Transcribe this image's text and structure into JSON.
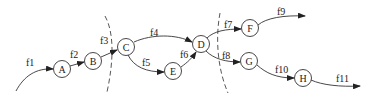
{
  "diagram": {
    "type": "directed-flow-graph",
    "nodes": [
      {
        "id": "A",
        "label": "A",
        "x": 62,
        "y": 69
      },
      {
        "id": "B",
        "label": "B",
        "x": 93,
        "y": 61
      },
      {
        "id": "C",
        "label": "C",
        "x": 126,
        "y": 47
      },
      {
        "id": "D",
        "label": "D",
        "x": 201,
        "y": 44
      },
      {
        "id": "E",
        "label": "E",
        "x": 173,
        "y": 71
      },
      {
        "id": "F",
        "label": "F",
        "x": 250,
        "y": 28
      },
      {
        "id": "G",
        "label": "G",
        "x": 249,
        "y": 61
      },
      {
        "id": "H",
        "label": "H",
        "x": 303,
        "y": 78
      }
    ],
    "edges": [
      {
        "label": "f1",
        "from": null,
        "to": "A"
      },
      {
        "label": "f2",
        "from": "A",
        "to": "B"
      },
      {
        "label": "f3",
        "from": "B",
        "to": "C"
      },
      {
        "label": "f4",
        "from": "C",
        "to": "D"
      },
      {
        "label": "f5",
        "from": "C",
        "to": "E"
      },
      {
        "label": "f6",
        "from": "E",
        "to": "D"
      },
      {
        "label": "f7",
        "from": "D",
        "to": "F"
      },
      {
        "label": "f8",
        "from": "D",
        "to": "G"
      },
      {
        "label": "f9",
        "from": "F",
        "to": null
      },
      {
        "label": "f10",
        "from": "G",
        "to": "H"
      },
      {
        "label": "f11",
        "from": "H",
        "to": null
      }
    ],
    "cuts": [
      {
        "name": "cut-1",
        "style": "dashed",
        "crosses": [
          "f3"
        ]
      },
      {
        "name": "cut-2",
        "style": "dashed",
        "crosses": [
          "f7",
          "f8"
        ]
      }
    ]
  }
}
